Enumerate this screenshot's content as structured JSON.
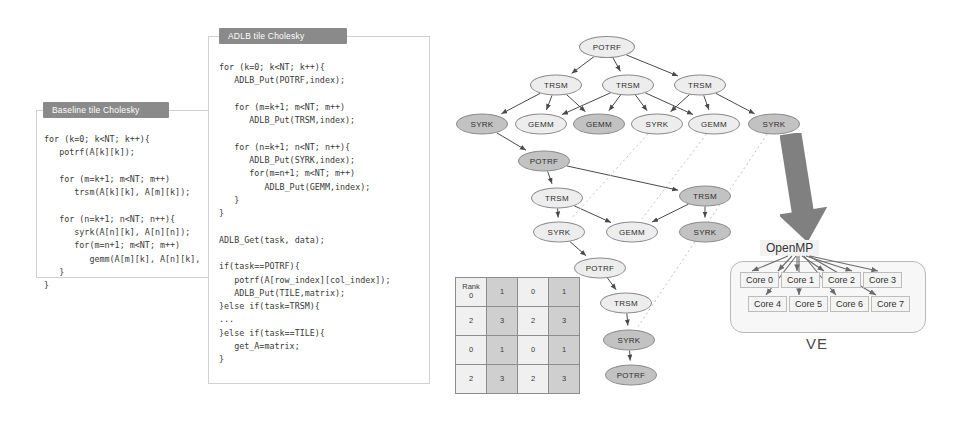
{
  "panels": {
    "baseline": {
      "title": "Baseline tile Cholesky",
      "code": "for (k=0; k<NT; k++){\n   potrf(A[k][k]);\n\n   for (m=k+1; m<NT; m++)\n      trsm(A[k][k], A[m][k]);\n\n   for (n=k+1; n<NT; n++){\n      syrk(A[n][k], A[n][n]);\n      for(m=n+1; m<NT; m++)\n         gemm(A[m][k], A[n][k],\n   }\n}"
    },
    "adlb": {
      "title": "ADLB tile Cholesky",
      "code": "for (k=0; k<NT; k++){\n   ADLB_Put(POTRF,index);\n\n   for (m=k+1; m<NT; m++)\n      ADLB_Put(TRSM,index);\n\n   for (n=k+1; n<NT; n++){\n      ADLB_Put(SYRK,index);\n      for(m=n+1; m<NT; m++)\n         ADLB_Put(GEMM,index);\n   }\n}\n\nADLB_Get(task, data);\n\nif(task==POTRF){\n   potrf(A[row_index][col_index]);\n   ADLB_Put(TILE,matrix);\n}else if(task=TRSM){\n...\n}else if(task==TILE){\n   get_A=matrix;\n}"
    }
  },
  "dag": {
    "nodes": [
      {
        "id": "n0",
        "label": "POTRF",
        "x": 167,
        "y": 47,
        "w": 56,
        "h": 22,
        "shade": "light"
      },
      {
        "id": "n1",
        "label": "TRSM",
        "x": 116,
        "y": 85,
        "w": 52,
        "h": 21,
        "shade": "light"
      },
      {
        "id": "n2",
        "label": "TRSM",
        "x": 188,
        "y": 85,
        "w": 52,
        "h": 21,
        "shade": "light"
      },
      {
        "id": "n3",
        "label": "TRSM",
        "x": 260,
        "y": 85,
        "w": 52,
        "h": 21,
        "shade": "light"
      },
      {
        "id": "n4",
        "label": "SYRK",
        "x": 42,
        "y": 124,
        "w": 52,
        "h": 21,
        "shade": "dark"
      },
      {
        "id": "n5",
        "label": "GEMM",
        "x": 101,
        "y": 124,
        "w": 52,
        "h": 21,
        "shade": "light"
      },
      {
        "id": "n6",
        "label": "GEMM",
        "x": 159,
        "y": 124,
        "w": 52,
        "h": 21,
        "shade": "dark"
      },
      {
        "id": "n7",
        "label": "SYRK",
        "x": 217,
        "y": 124,
        "w": 52,
        "h": 21,
        "shade": "light"
      },
      {
        "id": "n8",
        "label": "GEMM",
        "x": 274,
        "y": 124,
        "w": 52,
        "h": 21,
        "shade": "light"
      },
      {
        "id": "n9",
        "label": "SYRK",
        "x": 334,
        "y": 124,
        "w": 52,
        "h": 21,
        "shade": "dark"
      },
      {
        "id": "n10",
        "label": "POTRF",
        "x": 104,
        "y": 161,
        "w": 52,
        "h": 21,
        "shade": "dark"
      },
      {
        "id": "n11",
        "label": "TRSM",
        "x": 117,
        "y": 198,
        "w": 52,
        "h": 21,
        "shade": "light"
      },
      {
        "id": "n12",
        "label": "TRSM",
        "x": 265,
        "y": 196,
        "w": 52,
        "h": 21,
        "shade": "dark"
      },
      {
        "id": "n13",
        "label": "SYRK",
        "x": 119,
        "y": 232,
        "w": 52,
        "h": 21,
        "shade": "light"
      },
      {
        "id": "n14",
        "label": "GEMM",
        "x": 192,
        "y": 232,
        "w": 52,
        "h": 21,
        "shade": "light"
      },
      {
        "id": "n15",
        "label": "SYRK",
        "x": 265,
        "y": 232,
        "w": 52,
        "h": 21,
        "shade": "dark"
      },
      {
        "id": "n16",
        "label": "POTRF",
        "x": 160,
        "y": 268,
        "w": 52,
        "h": 21,
        "shade": "light"
      },
      {
        "id": "n17",
        "label": "TRSM",
        "x": 186,
        "y": 303,
        "w": 52,
        "h": 21,
        "shade": "light"
      },
      {
        "id": "n18",
        "label": "SYRK",
        "x": 189,
        "y": 340,
        "w": 52,
        "h": 21,
        "shade": "dark"
      },
      {
        "id": "n19",
        "label": "POTRF",
        "x": 191,
        "y": 375,
        "w": 52,
        "h": 21,
        "shade": "dark"
      }
    ],
    "edges": [
      [
        "n0",
        "n1"
      ],
      [
        "n0",
        "n2"
      ],
      [
        "n0",
        "n3"
      ],
      [
        "n1",
        "n4"
      ],
      [
        "n1",
        "n5"
      ],
      [
        "n1",
        "n6"
      ],
      [
        "n2",
        "n5"
      ],
      [
        "n2",
        "n6"
      ],
      [
        "n2",
        "n7"
      ],
      [
        "n2",
        "n8"
      ],
      [
        "n3",
        "n7"
      ],
      [
        "n3",
        "n8"
      ],
      [
        "n3",
        "n9"
      ],
      [
        "n4",
        "n10"
      ],
      [
        "n10",
        "n11"
      ],
      [
        "n10",
        "n12"
      ],
      [
        "n11",
        "n13"
      ],
      [
        "n11",
        "n14"
      ],
      [
        "n12",
        "n14"
      ],
      [
        "n12",
        "n15"
      ],
      [
        "n13",
        "n16"
      ],
      [
        "n16",
        "n17"
      ],
      [
        "n17",
        "n18"
      ],
      [
        "n18",
        "n19"
      ]
    ],
    "dotted_edges": [
      [
        "n7",
        "n13"
      ],
      [
        "n8",
        "n14"
      ],
      [
        "n9",
        "n18"
      ]
    ]
  },
  "rank_matrix": {
    "corner_label": "Rank",
    "rows": [
      [
        "0",
        "1",
        "0",
        "1"
      ],
      [
        "2",
        "3",
        "2",
        "3"
      ],
      [
        "0",
        "1",
        "0",
        "1"
      ],
      [
        "2",
        "3",
        "2",
        "3"
      ]
    ],
    "shaded": [
      [
        false,
        true,
        false,
        true
      ],
      [
        false,
        true,
        false,
        true
      ],
      [
        false,
        true,
        false,
        true
      ],
      [
        false,
        true,
        false,
        true
      ]
    ]
  },
  "ve": {
    "openmp_label": "OpenMP",
    "ve_label": "VE",
    "cores_top": [
      "Core 0",
      "Core 1",
      "Core 2",
      "Core 3"
    ],
    "cores_bottom": [
      "Core 4",
      "Core 5",
      "Core 6",
      "Core 7"
    ]
  },
  "colors": {
    "node_light": "#ededed",
    "node_dark": "#c2c2c2",
    "header_bar": "#8a8a8a",
    "arrow_gray": "#808080",
    "matrix_shaded": "#cfcfcf"
  }
}
